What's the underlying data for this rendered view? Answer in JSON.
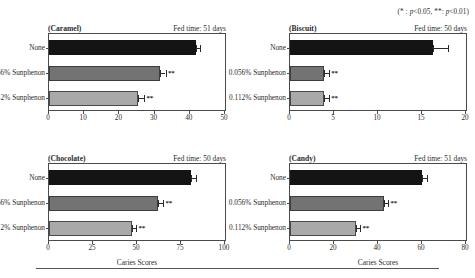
{
  "figure": {
    "significance_note": "(* : p<0.05, **: p<0.01)",
    "x_axis_title": "Caries Scores",
    "categories": [
      "None",
      "0.056% Sunphenon",
      "0.112% Sunphenon"
    ],
    "bottom_rule": true
  },
  "chart_data": [
    {
      "type": "bar",
      "orientation": "horizontal",
      "title": "(Caramel)",
      "annotation": "Fed time: 51 days",
      "xlabel": "Caries Scores",
      "ylabel": "",
      "categories": [
        "None",
        "0.056% Sunphenon",
        "0.112% Sunphenon"
      ],
      "values": [
        41.8,
        31.6,
        25.4
      ],
      "errors": [
        1.2,
        1.5,
        1.6
      ],
      "significance": [
        "",
        "**",
        "**"
      ],
      "xlim": [
        0,
        50
      ],
      "xticks": [
        0,
        10,
        20,
        30,
        40,
        50
      ],
      "grid": false,
      "legend": "none"
    },
    {
      "type": "bar",
      "orientation": "horizontal",
      "title": "(Biscuit)",
      "annotation": "Fed time: 50 days",
      "xlabel": "Caries Scores",
      "ylabel": "",
      "categories": [
        "None",
        "0.056% Sunphenon",
        "0.112% Sunphenon"
      ],
      "values": [
        16.2,
        3.9,
        3.9
      ],
      "errors": [
        1.8,
        0.5,
        0.5
      ],
      "significance": [
        "",
        "**",
        "**"
      ],
      "xlim": [
        0,
        20
      ],
      "xticks": [
        0,
        5,
        10,
        15,
        20
      ],
      "grid": false,
      "legend": "none"
    },
    {
      "type": "bar",
      "orientation": "horizontal",
      "title": "(Chocolate)",
      "annotation": "Fed time: 50 days",
      "xlabel": "Caries Scores",
      "ylabel": "",
      "categories": [
        "None",
        "0.056% Sunphenon",
        "0.112% Sunphenon"
      ],
      "values": [
        80.5,
        62.0,
        47.0
      ],
      "errors": [
        3.0,
        2.8,
        2.5
      ],
      "significance": [
        "",
        "**",
        "**"
      ],
      "xlim": [
        0,
        100
      ],
      "xticks": [
        0,
        25,
        50,
        75,
        100
      ],
      "grid": false,
      "legend": "none"
    },
    {
      "type": "bar",
      "orientation": "horizontal",
      "title": "(Candy)",
      "annotation": "Fed time: 51 days",
      "xlabel": "Caries Scores",
      "ylabel": "",
      "categories": [
        "None",
        "0.056% Sunphenon",
        "0.112% Sunphenon"
      ],
      "values": [
        60.2,
        42.8,
        30.0
      ],
      "errors": [
        2.2,
        1.8,
        1.8
      ],
      "significance": [
        "",
        "**",
        "**"
      ],
      "xlim": [
        0,
        80
      ],
      "xticks": [
        0,
        20,
        40,
        60,
        80
      ],
      "grid": false,
      "legend": "none"
    }
  ]
}
